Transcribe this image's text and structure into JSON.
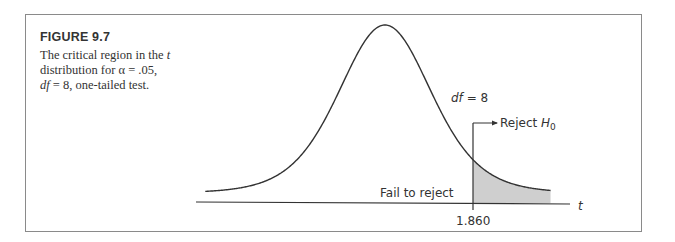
{
  "figure": {
    "title": "FIGURE 9.7",
    "caption_parts": {
      "line1_pre": "The critical region in the ",
      "line1_var": "t",
      "line2": "distribution for α = .05,",
      "line3_var": "df",
      "line3_post": " = 8, one-tailed test."
    }
  },
  "labels": {
    "df_var": "df",
    "df_value": " = 8",
    "reject_pre": "Reject ",
    "reject_var": "H",
    "reject_sub": "0",
    "fail": "Fail to reject",
    "critical": "1.860",
    "axis": "t"
  },
  "colors": {
    "curve": "#333333",
    "shade": "#cfcfcf",
    "frame": "#8a8a8a"
  },
  "chart_data": {
    "type": "area",
    "title": "FIGURE 9.7",
    "subtitle": "The critical region in the t distribution for α = .05, df = 8, one-tailed test.",
    "distribution": "t",
    "df": 8,
    "alpha": 0.05,
    "tails": "one-tailed (right)",
    "critical_value": 1.86,
    "xlabel": "t",
    "ylabel": "",
    "x_ticks": [
      1.86
    ],
    "regions": [
      {
        "name": "Fail to reject",
        "range": [
          "-inf",
          1.86
        ]
      },
      {
        "name": "Reject H0",
        "range": [
          1.86,
          "inf"
        ],
        "shaded": true
      }
    ],
    "annotations": [
      "df = 8",
      "Reject H0",
      "Fail to reject"
    ],
    "grid": false,
    "legend": "none"
  }
}
